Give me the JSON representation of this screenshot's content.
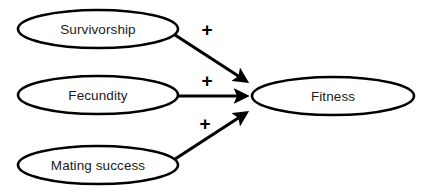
{
  "diagram": {
    "type": "path-diagram",
    "background_color": "#ffffff",
    "stroke_color": "#000000",
    "text_color": "#1a1a1a",
    "nodes": [
      {
        "id": "survivorship",
        "label": "Survivorship",
        "shape": "ellipse",
        "cx": 98,
        "cy": 29,
        "rx": 80,
        "ry": 19
      },
      {
        "id": "fecundity",
        "label": "Fecundity",
        "shape": "ellipse",
        "cx": 98,
        "cy": 95,
        "rx": 80,
        "ry": 19
      },
      {
        "id": "mating_success",
        "label": "Mating success",
        "shape": "ellipse",
        "cx": 98,
        "cy": 165,
        "rx": 80,
        "ry": 19
      },
      {
        "id": "fitness",
        "label": "Fitness",
        "shape": "ellipse",
        "cx": 333,
        "cy": 96,
        "rx": 81,
        "ry": 19
      }
    ],
    "edges": [
      {
        "id": "survivorship-to-fitness",
        "from": "survivorship",
        "to": "fitness",
        "sign": "+",
        "sign_x": 207,
        "sign_y": 30,
        "x1": 172,
        "y1": 33,
        "x2": 250,
        "y2": 84
      },
      {
        "id": "fecundity-to-fitness",
        "from": "fecundity",
        "to": "fitness",
        "sign": "+",
        "sign_x": 207,
        "sign_y": 81,
        "x1": 178,
        "y1": 96,
        "x2": 251,
        "y2": 96
      },
      {
        "id": "mating-success-to-fitness",
        "from": "mating_success",
        "to": "fitness",
        "sign": "+",
        "sign_x": 205,
        "sign_y": 124,
        "x1": 172,
        "y1": 161,
        "x2": 250,
        "y2": 110
      }
    ]
  }
}
